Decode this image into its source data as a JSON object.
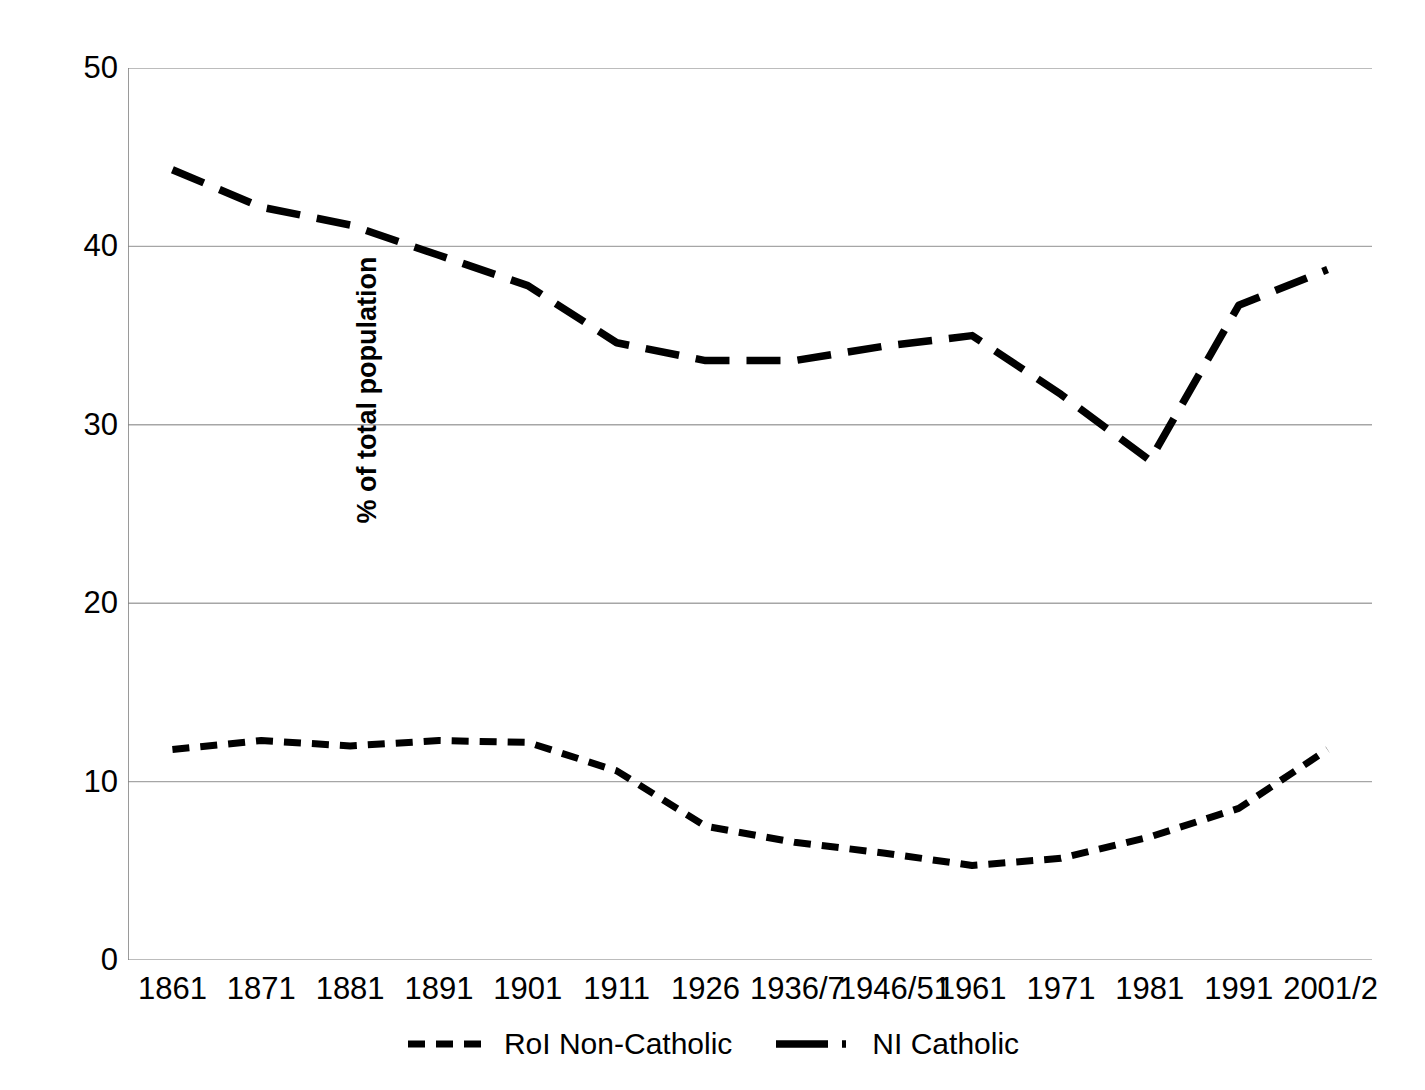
{
  "chart_data": {
    "type": "line",
    "title": "",
    "xlabel": "",
    "ylabel": "% of total population",
    "ylim": [
      0,
      50
    ],
    "yticks": [
      0,
      10,
      20,
      30,
      40,
      50
    ],
    "ytick_labels": [
      "0",
      "10",
      "20",
      "30",
      "40",
      "50"
    ],
    "grid": "horizontal",
    "legend_position": "bottom",
    "categories": [
      "1861",
      "1871",
      "1881",
      "1891",
      "1901",
      "1911",
      "1926",
      "1936/7",
      "1946/51",
      "1961",
      "1971",
      "1981",
      "1991",
      "2001/2"
    ],
    "series": [
      {
        "name": "RoI Non-Catholic",
        "style": "dashed-short",
        "color": "#000000",
        "values": [
          11.8,
          12.3,
          12.0,
          12.3,
          12.2,
          10.6,
          7.5,
          6.6,
          6.0,
          5.3,
          5.7,
          6.9,
          8.5,
          11.8
        ]
      },
      {
        "name": "NI Catholic",
        "style": "dash-dot-long",
        "color": "#000000",
        "values": [
          44.3,
          42.2,
          41.2,
          39.5,
          37.8,
          34.6,
          33.6,
          33.6,
          34.4,
          35.0,
          31.7,
          28.0,
          36.7,
          38.7
        ]
      }
    ]
  },
  "axes": {
    "y_title": "% of total population"
  },
  "legend": {
    "entries": [
      {
        "label": "RoI Non-Catholic"
      },
      {
        "label": "NI Catholic"
      }
    ]
  },
  "colors": {
    "series_line": "#000000",
    "gridline": "#a6a6a6",
    "axis": "#808080",
    "background": "#ffffff"
  }
}
